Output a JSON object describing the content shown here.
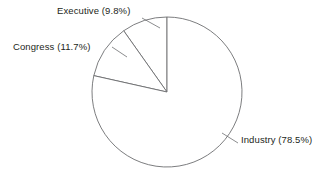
{
  "chart_data": {
    "type": "pie",
    "title": "",
    "subtitle": "",
    "xlabel": "",
    "ylabel": "",
    "legend_position": "none",
    "grid": false,
    "style": {
      "fill_color": "#ffffff",
      "stroke_color": "#6d6e71",
      "text_color": "#231f20",
      "background_color": "#ffffff",
      "start_angle_deg": 90,
      "direction": "counterclockwise"
    },
    "geometry": {
      "center_x": 167,
      "center_y": 92,
      "radius": 75
    },
    "categories": [
      "Executive",
      "Congress",
      "Industry"
    ],
    "values": [
      9.8,
      11.7,
      78.5
    ],
    "units": "percent",
    "slices": [
      {
        "name": "Executive",
        "value": 9.8,
        "label": "Executive (9.8%)",
        "angle_deg": 35.3,
        "start_deg": 90,
        "end_deg": 125.3
      },
      {
        "name": "Congress",
        "value": 11.7,
        "label": "Congress (11.7%)",
        "angle_deg": 42.1,
        "start_deg": 125.3,
        "end_deg": 167.4
      },
      {
        "name": "Industry",
        "value": 78.5,
        "label": "Industry (78.5%)",
        "angle_deg": 282.6,
        "start_deg": 167.4,
        "end_deg": 450
      }
    ],
    "annotations": []
  },
  "labels": {
    "executive": "Executive (9.8%)",
    "congress": "Congress (11.7%)",
    "industry": "Industry (78.5%)"
  }
}
